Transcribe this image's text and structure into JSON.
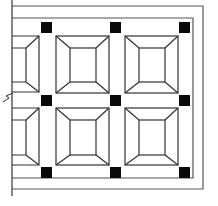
{
  "diagram": {
    "type": "tile-pattern",
    "colors": {
      "line": "#333333",
      "border": "#555555",
      "square_fill": "#0a0a0a",
      "background": "#ffffff"
    },
    "grid": {
      "columns_visible": 3,
      "rows_visible": 2,
      "left_column_partial": true
    },
    "corner_squares_count": 9,
    "frames_count": 6
  }
}
